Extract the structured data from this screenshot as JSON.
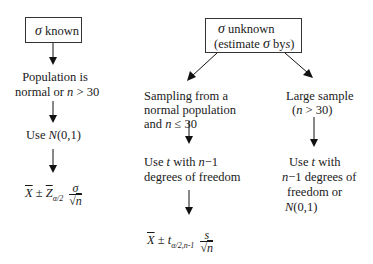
{
  "left_branch": {
    "box_label": {
      "symbol": "σ",
      "text": "known"
    },
    "condition": {
      "line1": "Population is",
      "line2_prefix": "normal or",
      "line2_var": "n",
      "line2_suffix": "> 30"
    },
    "distribution": {
      "prefix": "Use",
      "dist": "N",
      "args": "(0,1)"
    },
    "formula": {
      "xbar": "X",
      "pm": "±",
      "z": "Z",
      "z_sub": "α/2",
      "num": "σ",
      "den_sqrt": "√",
      "den_var": "n"
    }
  },
  "right_branch": {
    "box_label": {
      "line1_symbol": "σ",
      "line1_text": "unknown",
      "line2_prefix": "(estimate",
      "line2_symbol": "σ",
      "line2_mid": "by",
      "line2_var": "s",
      "line2_suffix": ")"
    },
    "small_sample": {
      "condition": {
        "line1": "Sampling from a",
        "line2": "normal population",
        "line3_prefix": "and",
        "line3_var": "n",
        "line3_suffix": "≤ 30"
      },
      "distribution": {
        "line1_prefix": "Use",
        "line1_var": "t",
        "line1_mid": "with",
        "line1_var2": "n",
        "line1_suffix": "−1",
        "line2": "degrees of freedom"
      },
      "formula": {
        "xbar": "X",
        "pm": "±",
        "t": "t",
        "t_sub": "α/2,n-1",
        "num": "s",
        "den_sqrt": "√",
        "den_var": "n"
      }
    },
    "large_sample": {
      "condition": {
        "line1": "Large sample",
        "line2_prefix": "(",
        "line2_var": "n",
        "line2_suffix": "> 30)"
      },
      "distribution": {
        "line1_prefix": "Use",
        "line1_var": "t",
        "line1_suffix": "with",
        "line2_var": "n",
        "line2_suffix": "−1 degrees of",
        "line3": "freedom or",
        "line4_dist": "N",
        "line4_args": "(0,1)"
      }
    }
  }
}
